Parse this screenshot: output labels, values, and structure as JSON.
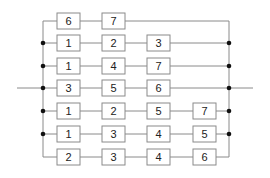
{
  "diagram": {
    "type": "reliability-block-diagram",
    "colors": {
      "line": "#8a8a8a",
      "junction": "#111111",
      "box_fill": "#ffffff",
      "text": "#222222"
    },
    "rows": [
      {
        "blocks": [
          "6",
          "7"
        ]
      },
      {
        "blocks": [
          "1",
          "2",
          "3"
        ]
      },
      {
        "blocks": [
          "1",
          "4",
          "7"
        ]
      },
      {
        "blocks": [
          "3",
          "5",
          "6"
        ]
      },
      {
        "blocks": [
          "1",
          "2",
          "5",
          "7"
        ]
      },
      {
        "blocks": [
          "1",
          "3",
          "4",
          "5"
        ]
      },
      {
        "blocks": [
          "2",
          "3",
          "4",
          "6"
        ]
      }
    ]
  }
}
